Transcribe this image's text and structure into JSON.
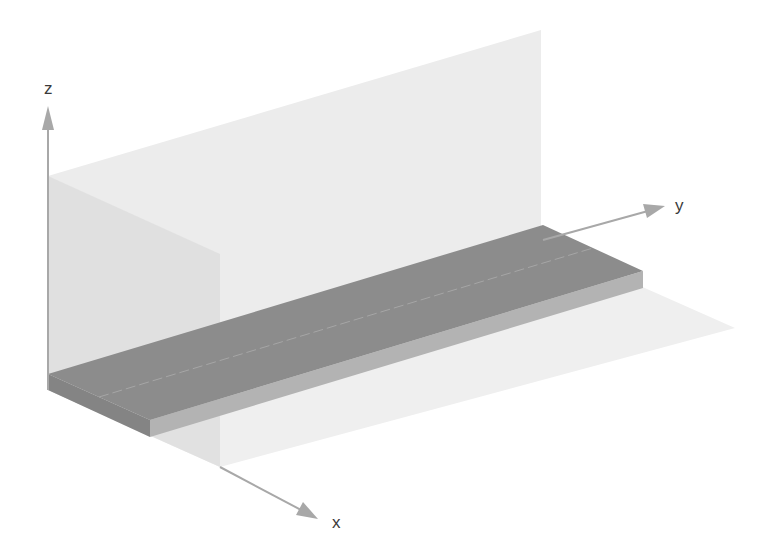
{
  "diagram": {
    "type": "3d-axonometric-illustration",
    "axes": {
      "x": {
        "label": "x"
      },
      "y": {
        "label": "y"
      },
      "z": {
        "label": "z"
      }
    },
    "planes": [
      {
        "name": "y-z plane (back wall)",
        "color": "#ececec"
      },
      {
        "name": "x-z plane (side wall)",
        "color": "#dcdcdc"
      },
      {
        "name": "x-y plane (floor)",
        "color": "#efefef"
      }
    ],
    "slab": {
      "top_color": "#8c8c8c",
      "front_color": "#b3b3b3",
      "end_color": "#7a7a7a",
      "centerline": "dashed"
    },
    "colors": {
      "axis": "#a8a8a8",
      "label": "#3a3a3a",
      "background": "#ffffff"
    }
  }
}
